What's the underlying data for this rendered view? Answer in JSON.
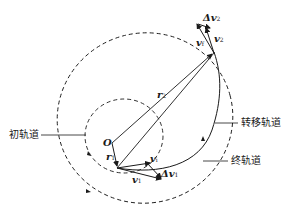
{
  "diagram": {
    "title": "",
    "labels": {
      "origin": "O",
      "r1": "r",
      "r1_sub": "1",
      "r2": "r",
      "r2_sub": "2",
      "v1": "v",
      "v1_sub": "1",
      "vi": "v",
      "vi_sub": "i",
      "dv1": "Δv",
      "dv1_sub": "1",
      "v2": "v",
      "v2_sub": "2",
      "vf": "v",
      "vf_sub": "f",
      "dv2": "Δv",
      "dv2_sub": "2",
      "initial_orbit": "初轨道",
      "transfer_orbit": "转移轨道",
      "final_orbit": "终轨道"
    },
    "colors": {
      "line": "#1a1a1a",
      "background": "#ffffff"
    }
  }
}
